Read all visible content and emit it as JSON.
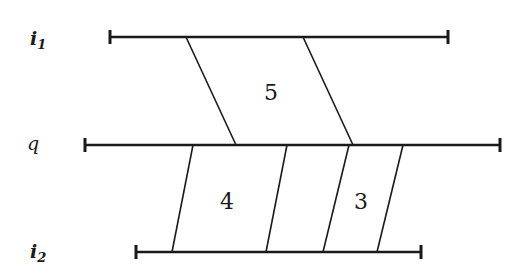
{
  "diagram": {
    "lines": [
      {
        "id": "i1",
        "label": "i",
        "subscript": "1",
        "x1": 110,
        "x2": 448,
        "y": 37
      },
      {
        "id": "q",
        "label": "q",
        "subscript": "",
        "x1": 85,
        "x2": 500,
        "y": 145
      },
      {
        "id": "i2",
        "label": "i",
        "subscript": "2",
        "x1": 136,
        "x2": 421,
        "y": 252
      }
    ],
    "regions": [
      {
        "label": "5",
        "between": [
          "i1",
          "q"
        ]
      },
      {
        "label": "4",
        "between": [
          "q",
          "i2"
        ]
      },
      {
        "label": "3",
        "between": [
          "q",
          "i2"
        ]
      }
    ],
    "labels": {
      "i1_main": "i",
      "i1_sub": "1",
      "q": "q",
      "i2_main": "i",
      "i2_sub": "2",
      "region_5": "5",
      "region_4": "4",
      "region_3": "3"
    }
  }
}
